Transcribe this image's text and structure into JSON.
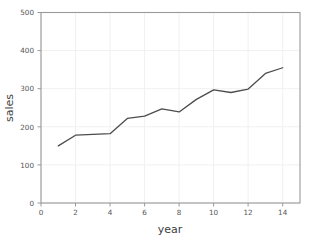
{
  "chart_data": {
    "type": "line",
    "title": "",
    "xlabel": "year",
    "ylabel": "sales",
    "x": [
      1,
      2,
      3,
      4,
      5,
      6,
      7,
      8,
      9,
      10,
      11,
      12,
      13,
      14
    ],
    "values": [
      150,
      178,
      180,
      182,
      222,
      228,
      247,
      239,
      272,
      297,
      290,
      299,
      340,
      355
    ],
    "series": [
      {
        "name": "sales",
        "values": [
          150,
          178,
          180,
          182,
          222,
          228,
          247,
          239,
          272,
          297,
          290,
          299,
          340,
          355
        ]
      }
    ],
    "xlim": [
      0,
      15
    ],
    "ylim": [
      0,
      500
    ],
    "xticks": [
      0,
      2,
      4,
      6,
      8,
      10,
      12,
      14
    ],
    "xticklabels": [
      "0",
      "2",
      "4",
      "6",
      "8",
      "10",
      "12",
      "14"
    ],
    "yticks": [
      0,
      100,
      200,
      300,
      400,
      500
    ],
    "yticklabels": [
      "0",
      "100",
      "200",
      "300",
      "400",
      "500"
    ],
    "grid": true,
    "legend": null,
    "line_color": "#4d4d4d",
    "grid_color": "#f0f0f0",
    "axis_color": "#9a9a9a",
    "background_color": "#ffffff"
  }
}
